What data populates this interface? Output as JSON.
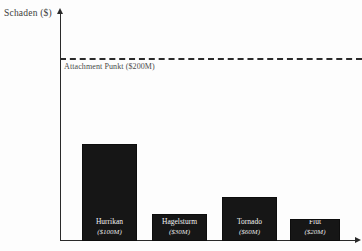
{
  "axes": {
    "y_label": "Schaden ($)"
  },
  "threshold": {
    "label": "Attachment Punkt ($200M)",
    "value": 200
  },
  "chart_data": {
    "type": "bar",
    "title": "",
    "xlabel": "",
    "ylabel": "Schaden ($)",
    "categories": [
      "Hurrikan",
      "Hagelsturm",
      "Tornado",
      "Flut"
    ],
    "values": [
      100,
      30,
      60,
      20
    ],
    "value_labels": [
      "($100M)",
      "($30M)",
      "($60M)",
      "($20M)"
    ],
    "unit": "Millionen USD",
    "ylim": [
      0,
      260
    ],
    "grid": false,
    "legend": "none",
    "annotations": [
      {
        "type": "threshold-line",
        "label": "Attachment Punkt ($200M)",
        "value": 200,
        "style": "dashed"
      }
    ],
    "bar_color": "#161616",
    "axis_color": "#2a2a2a"
  }
}
